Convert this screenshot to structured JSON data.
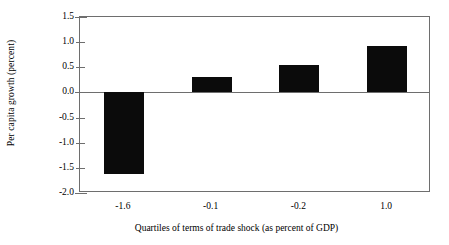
{
  "chart_data": {
    "type": "bar",
    "title": "",
    "subtitle": "",
    "xlabel": "Quartiles of terms of trade shock (as percent of GDP)",
    "ylabel": "Per capita growth (percent)",
    "categories": [
      "-1.6",
      "-0.1",
      "-0.2",
      "1.0"
    ],
    "values": [
      -1.62,
      0.3,
      0.55,
      0.92
    ],
    "series": [
      {
        "name": "Per capita growth",
        "values": [
          -1.62,
          0.3,
          0.55,
          0.92
        ],
        "color": "#0b0b0b"
      }
    ],
    "ylim": [
      -2.0,
      1.5
    ],
    "ytick_labels": [
      "1.5",
      "1.0",
      "0.5",
      "0.0",
      "-0.5",
      "-1.0",
      "-1.5",
      "-2.0"
    ],
    "ytick_values": [
      1.5,
      1.0,
      0.5,
      0.0,
      -0.5,
      -1.0,
      -1.5,
      -2.0
    ],
    "grid": false,
    "legend": false,
    "legend_position": "none",
    "zero_line": true,
    "frame_color": "#6e6e6e",
    "background_color": "#ffffff"
  }
}
